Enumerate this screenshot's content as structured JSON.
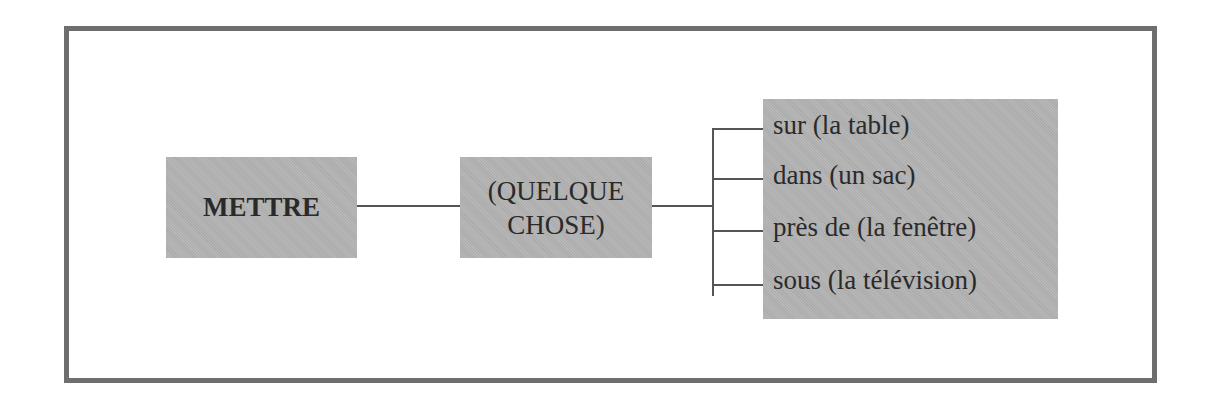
{
  "diagram": {
    "verb": "METTRE",
    "object": {
      "line1": "(QUELQUE",
      "line2": "CHOSE)"
    },
    "places": [
      "sur (la table)",
      "dans (un sac)",
      "près de (la fenêtre)",
      "sous (la télévision)"
    ]
  },
  "colors": {
    "frame_border": "#6e6e6e",
    "box_fill": "#b3b3b3",
    "connector": "#555555",
    "text": "#2a2a2a"
  }
}
